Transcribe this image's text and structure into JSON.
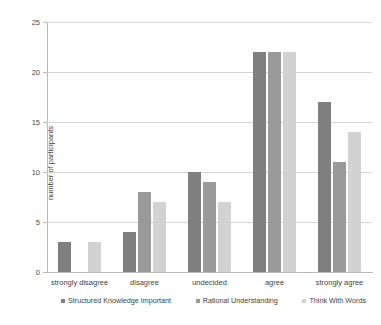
{
  "chart_data": {
    "type": "bar",
    "title": "",
    "xlabel": "",
    "ylabel": "number of participants",
    "ylim": [
      0,
      25
    ],
    "ytick_values": [
      0,
      5,
      10,
      15,
      20,
      25
    ],
    "ytick_labels": [
      "0",
      "5",
      "10",
      "15",
      "20",
      "25"
    ],
    "grid": true,
    "legend_position": "below-axis",
    "categories": [
      "strongly disagree",
      "disagree",
      "undecided",
      "agree",
      "strongly agree"
    ],
    "series": [
      {
        "name": "Structured Knowledge Important",
        "color": "#7f7f7f",
        "values": [
          3,
          4,
          10,
          22,
          17
        ]
      },
      {
        "name": "Rational Understanding",
        "color": "#9a9a9a",
        "values": [
          0,
          8,
          9,
          22,
          11
        ]
      },
      {
        "name": "Think With Words",
        "color": "#d2d2d2",
        "values": [
          3,
          7,
          7,
          22,
          14
        ]
      }
    ]
  },
  "caption": {
    "text": ""
  }
}
